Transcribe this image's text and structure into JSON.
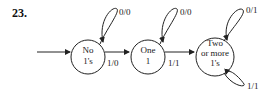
{
  "problem_number": "23.",
  "states": [
    {
      "id": "s0",
      "line1": "No",
      "line2": "1's",
      "line3": ""
    },
    {
      "id": "s1",
      "line1": "One",
      "line2": "1",
      "line3": ""
    },
    {
      "id": "s2",
      "line1": "Two",
      "line2": "or more",
      "line3": "1's"
    }
  ],
  "transitions": [
    {
      "from": "s0",
      "to": "s0",
      "label": "0/0"
    },
    {
      "from": "s0",
      "to": "s1",
      "label": "1/0"
    },
    {
      "from": "s1",
      "to": "s1",
      "label": "0/0"
    },
    {
      "from": "s1",
      "to": "s2",
      "label": "1/1"
    },
    {
      "from": "s2",
      "to": "s2",
      "label": "0/1"
    },
    {
      "from": "s2",
      "to": "s2",
      "label": "1/1"
    }
  ],
  "colors": {
    "stroke": "#222222",
    "background": "#ffffff"
  }
}
